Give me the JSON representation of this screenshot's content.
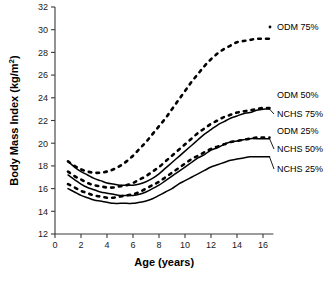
{
  "chart_data": {
    "type": "line",
    "title": "",
    "xlabel": "Age (years)",
    "ylabel": "Body Mass Index (kg/m2)",
    "ylabel_base": "Body Mass Index (kg/m",
    "ylabel_exponent": "2",
    "ylabel_close": ")",
    "xlim": [
      0,
      16.8
    ],
    "ylim": [
      12,
      32
    ],
    "xticks": [
      0,
      2,
      4,
      6,
      8,
      10,
      12,
      14,
      16
    ],
    "yticks": [
      12,
      14,
      16,
      18,
      20,
      22,
      24,
      26,
      28,
      30,
      32
    ],
    "xticklabels": [
      "0",
      "2",
      "4",
      "6",
      "8",
      "10",
      "12",
      "14",
      "16"
    ],
    "yticklabels": [
      "12",
      "14",
      "16",
      "18",
      "20",
      "22",
      "24",
      "26",
      "28",
      "30",
      "32"
    ],
    "grid": false,
    "legend_position": "right-inline",
    "x": [
      1,
      1.5,
      2,
      2.5,
      3,
      3.5,
      4,
      4.5,
      5,
      5.5,
      6,
      6.5,
      7,
      7.5,
      8,
      8.5,
      9,
      9.5,
      10,
      10.5,
      11,
      11.5,
      12,
      12.5,
      13,
      13.5,
      14,
      14.5,
      15,
      15.5,
      16,
      16.5
    ],
    "series": [
      {
        "name": "ODM 75%",
        "style": "dotted",
        "color": "#000000",
        "label": "ODM 75%",
        "values": [
          18.4,
          18.0,
          17.7,
          17.5,
          17.4,
          17.4,
          17.5,
          17.7,
          18.0,
          18.4,
          18.9,
          19.5,
          20.1,
          20.8,
          21.5,
          22.2,
          23.0,
          23.8,
          24.6,
          25.4,
          26.1,
          26.8,
          27.4,
          27.9,
          28.3,
          28.6,
          28.9,
          29.0,
          29.1,
          29.2,
          29.2,
          29.2
        ]
      },
      {
        "name": "ODM 50%",
        "style": "dotted",
        "color": "#000000",
        "label": "ODM 50%",
        "values": [
          17.5,
          17.1,
          16.8,
          16.5,
          16.3,
          16.2,
          16.1,
          16.1,
          16.2,
          16.3,
          16.5,
          16.8,
          17.1,
          17.5,
          17.9,
          18.4,
          18.9,
          19.4,
          19.9,
          20.4,
          20.9,
          21.3,
          21.7,
          22.0,
          22.3,
          22.5,
          22.7,
          22.8,
          22.9,
          23.0,
          23.1,
          23.1
        ]
      },
      {
        "name": "NCHS 75%",
        "style": "solid",
        "color": "#000000",
        "label": "NCHS 75%",
        "values": [
          18.4,
          17.9,
          17.5,
          17.2,
          16.9,
          16.7,
          16.5,
          16.4,
          16.3,
          16.3,
          16.3,
          16.4,
          16.6,
          16.9,
          17.3,
          17.8,
          18.3,
          18.8,
          19.3,
          19.8,
          20.3,
          20.8,
          21.2,
          21.6,
          21.9,
          22.2,
          22.4,
          22.6,
          22.7,
          22.9,
          23.0,
          23.0
        ]
      },
      {
        "name": "ODM 25%",
        "style": "dotted",
        "color": "#000000",
        "label": "ODM 25%",
        "values": [
          16.4,
          16.1,
          15.8,
          15.6,
          15.4,
          15.3,
          15.2,
          15.2,
          15.3,
          15.4,
          15.5,
          15.7,
          16.0,
          16.3,
          16.6,
          17.0,
          17.4,
          17.8,
          18.2,
          18.6,
          18.9,
          19.2,
          19.5,
          19.7,
          19.9,
          20.1,
          20.2,
          20.3,
          20.4,
          20.5,
          20.5,
          20.5
        ]
      },
      {
        "name": "NCHS 50%",
        "style": "solid",
        "color": "#000000",
        "label": "NCHS 50%",
        "values": [
          17.2,
          16.8,
          16.4,
          16.1,
          15.9,
          15.7,
          15.6,
          15.5,
          15.4,
          15.4,
          15.4,
          15.5,
          15.7,
          16.0,
          16.3,
          16.7,
          17.1,
          17.5,
          17.9,
          18.3,
          18.7,
          19.0,
          19.4,
          19.6,
          19.9,
          20.1,
          20.2,
          20.3,
          20.4,
          20.4,
          20.4,
          20.4
        ]
      },
      {
        "name": "NCHS 25%",
        "style": "solid",
        "color": "#000000",
        "label": "NCHS 25%",
        "values": [
          16.0,
          15.7,
          15.4,
          15.2,
          15.0,
          14.9,
          14.8,
          14.7,
          14.7,
          14.7,
          14.7,
          14.8,
          14.9,
          15.1,
          15.4,
          15.7,
          16.0,
          16.4,
          16.7,
          17.0,
          17.3,
          17.6,
          17.9,
          18.1,
          18.3,
          18.5,
          18.6,
          18.7,
          18.8,
          18.8,
          18.8,
          18.8
        ]
      }
    ],
    "legend_entries": [
      {
        "label": "ODM 75%",
        "marker": "dot"
      },
      {
        "label": "ODM 50%",
        "marker": "none"
      },
      {
        "label": "NCHS 75%",
        "marker": "none"
      },
      {
        "label": "ODM 25%",
        "marker": "none"
      },
      {
        "label": "NCHS 50%",
        "marker": "none"
      },
      {
        "label": "NCHS 25%",
        "marker": "none"
      }
    ]
  }
}
